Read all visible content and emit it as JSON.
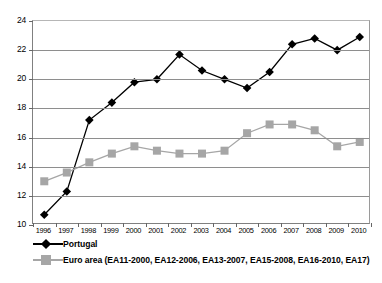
{
  "chart_data": {
    "type": "line",
    "title": "",
    "subtitle": "",
    "xlabel": "",
    "ylabel": "",
    "categories": [
      "1996",
      "1997",
      "1998",
      "1999",
      "2000",
      "2001",
      "2002",
      "2003",
      "2004",
      "2005",
      "2006",
      "2007",
      "2008",
      "2009",
      "2010"
    ],
    "x": [
      1996,
      1997,
      1998,
      1999,
      2000,
      2001,
      2002,
      2003,
      2004,
      2005,
      2006,
      2007,
      2008,
      2009,
      2010
    ],
    "ylim": [
      10,
      24
    ],
    "yticks": [
      10,
      12,
      14,
      16,
      18,
      20,
      22,
      24
    ],
    "ytick_labels": [
      "10",
      "12",
      "14",
      "16",
      "18",
      "20",
      "22",
      "24"
    ],
    "grid": "horizontal",
    "legend_position": "bottom-left",
    "series": [
      {
        "name": "Portugal",
        "marker": "diamond",
        "color": "#000000",
        "values": [
          10.7,
          12.3,
          17.2,
          18.4,
          19.8,
          20.0,
          21.7,
          20.6,
          20.0,
          19.4,
          20.5,
          22.4,
          22.8,
          22.0,
          22.9
        ]
      },
      {
        "name": "Euro area (EA11-2000, EA12-2006, EA13-2007, EA15-2008, EA16-2010, EA17)",
        "marker": "square",
        "color": "#a6a6a6",
        "values": [
          13.0,
          13.6,
          14.3,
          14.9,
          15.4,
          15.1,
          14.9,
          14.9,
          15.1,
          16.3,
          16.9,
          16.9,
          16.5,
          15.4,
          15.7
        ]
      }
    ]
  },
  "legend": {
    "items": [
      {
        "label": "Portugal",
        "color": "#000000",
        "marker": "diamond"
      },
      {
        "label": "Euro area (EA11-2000, EA12-2006, EA13-2007, EA15-2008, EA16-2010, EA17)",
        "color": "#a6a6a6",
        "marker": "square"
      }
    ]
  }
}
